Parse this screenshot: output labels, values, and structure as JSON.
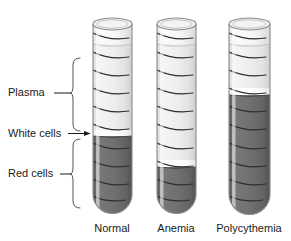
{
  "figure": {
    "background_color": "#ffffff"
  },
  "labels": [
    {
      "id": "plasma",
      "text": "Plasma",
      "x": 8,
      "y": 96,
      "connector": "brace",
      "brace_top": 58,
      "brace_bottom": 131,
      "leader_from_x": 54,
      "leader_to_x": 70,
      "leader_y": 93
    },
    {
      "id": "white-cells",
      "text": "White cells",
      "x": 8,
      "y": 137,
      "connector": "arrow",
      "leader_from_x": 66,
      "leader_to_x": 88,
      "leader_y": 134
    },
    {
      "id": "red-cells",
      "text": "Red cells",
      "x": 8,
      "y": 177,
      "connector": "brace",
      "brace_top": 138,
      "brace_bottom": 208,
      "leader_from_x": 60,
      "leader_to_x": 70,
      "leader_y": 174
    }
  ],
  "colors": {
    "plasma": "#e9e9e9",
    "plasma_light": "#f2f2f2",
    "buffy_coat": "#fbfbfb",
    "red_cells": "#6e6e6e",
    "red_cells_dark": "#5f5f5f",
    "glass_outline": "#8a8a8a",
    "graduation_dark": "#2e2e2e",
    "graduation_light": "#8f8f8f",
    "text": "#1a1a1a",
    "brace": "#555555",
    "background": "#ffffff"
  },
  "tubes": [
    {
      "id": "normal",
      "caption": "Normal",
      "caption_x": 112,
      "caption_y": 232,
      "left": 93,
      "right": 132,
      "top": 20,
      "bottom": 212,
      "rim_ry": 6,
      "air_level": 44,
      "plasma_top": 44,
      "buffy_top": 130,
      "buffy_bottom": 136,
      "red_cells_top": 136,
      "hematocrit_percent": 45,
      "graduations": [
        {
          "y": 36,
          "tone": "dark"
        },
        {
          "y": 55,
          "tone": "dark"
        },
        {
          "y": 73,
          "tone": "dark"
        },
        {
          "y": 91,
          "tone": "dark"
        },
        {
          "y": 109,
          "tone": "dark"
        },
        {
          "y": 127,
          "tone": "dark"
        },
        {
          "y": 146,
          "tone": "dark"
        },
        {
          "y": 164,
          "tone": "dark"
        },
        {
          "y": 182,
          "tone": "dark"
        },
        {
          "y": 198,
          "tone": "dark"
        }
      ]
    },
    {
      "id": "anemia",
      "caption": "Anemia",
      "caption_x": 176,
      "caption_y": 232,
      "left": 157,
      "right": 196,
      "top": 20,
      "bottom": 212,
      "rim_ry": 6,
      "air_level": 44,
      "plasma_top": 44,
      "buffy_top": 160,
      "buffy_bottom": 167,
      "red_cells_top": 167,
      "hematocrit_percent": 24,
      "graduations": [
        {
          "y": 36,
          "tone": "dark"
        },
        {
          "y": 55,
          "tone": "dark"
        },
        {
          "y": 73,
          "tone": "dark"
        },
        {
          "y": 91,
          "tone": "dark"
        },
        {
          "y": 109,
          "tone": "dark"
        },
        {
          "y": 127,
          "tone": "dark"
        },
        {
          "y": 146,
          "tone": "dark"
        },
        {
          "y": 164,
          "tone": "dark"
        },
        {
          "y": 182,
          "tone": "dark"
        },
        {
          "y": 198,
          "tone": "dark"
        }
      ]
    },
    {
      "id": "polycythemia",
      "caption": "Polycythemia",
      "caption_x": 249,
      "caption_y": 232,
      "left": 229,
      "right": 270,
      "top": 20,
      "bottom": 212,
      "rim_ry": 6,
      "air_level": 44,
      "plasma_top": 44,
      "buffy_top": 88,
      "buffy_bottom": 95,
      "red_cells_top": 95,
      "hematocrit_percent": 68,
      "graduations": [
        {
          "y": 36,
          "tone": "dark"
        },
        {
          "y": 55,
          "tone": "dark"
        },
        {
          "y": 73,
          "tone": "dark"
        },
        {
          "y": 91,
          "tone": "dark"
        },
        {
          "y": 109,
          "tone": "dark"
        },
        {
          "y": 127,
          "tone": "dark"
        },
        {
          "y": 146,
          "tone": "dark"
        },
        {
          "y": 164,
          "tone": "dark"
        },
        {
          "y": 182,
          "tone": "dark"
        },
        {
          "y": 198,
          "tone": "dark"
        }
      ]
    }
  ]
}
